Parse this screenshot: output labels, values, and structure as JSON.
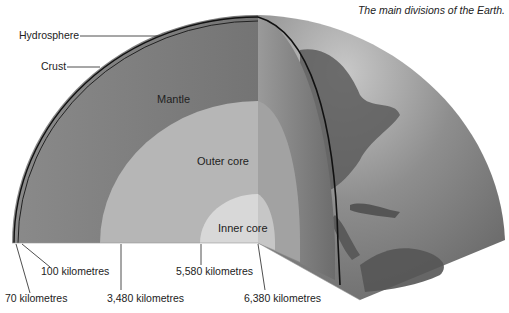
{
  "caption": "The main divisions of the Earth.",
  "layers": {
    "hydrosphere": "Hydrosphere",
    "crust": "Crust",
    "mantle": "Mantle",
    "outer_core": "Outer core",
    "inner_core": "Inner core"
  },
  "depths": {
    "d70": "70 kilometres",
    "d100": "100 kilometres",
    "d3480": "3,480 kilometres",
    "d5580": "5,580 kilometres",
    "d6380": "6,380 kilometres"
  },
  "colors": {
    "mantle": "#7a7a7a",
    "outer_core": "#b4b4b4",
    "inner_core": "#d9d9d9",
    "surface": "#8a8a8a",
    "land": "#5e5e5e"
  }
}
